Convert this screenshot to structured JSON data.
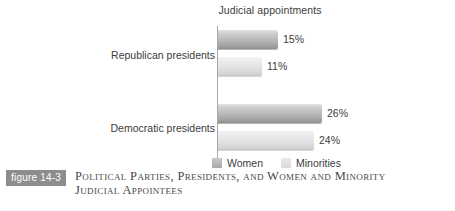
{
  "chart_data": {
    "type": "bar",
    "orientation": "horizontal",
    "title": "Judicial appointments",
    "xlabel": "",
    "ylabel": "",
    "categories": [
      "Republican presidents",
      "Democratic presidents"
    ],
    "series": [
      {
        "name": "Women",
        "color": "#b0b0b0",
        "values": [
          15,
          24
        ],
        "value_labels": [
          "15%",
          "26%"
        ]
      },
      {
        "name": "Minorities",
        "color": "#e0e0e0",
        "values": [
          11,
          24
        ],
        "value_labels": [
          "11%",
          "24%"
        ]
      }
    ],
    "bars": [
      {
        "category": "Republican presidents",
        "series": "Women",
        "value": 15,
        "label": "15%"
      },
      {
        "category": "Republican presidents",
        "series": "Minorities",
        "value": 11,
        "label": "11%"
      },
      {
        "category": "Democratic presidents",
        "series": "Women",
        "value": 26,
        "label": "26%"
      },
      {
        "category": "Democratic presidents",
        "series": "Minorities",
        "value": 24,
        "label": "24%"
      }
    ],
    "xlim": [
      0,
      30
    ],
    "grid": false,
    "legend_position": "bottom",
    "legend": [
      "Women",
      "Minorities"
    ],
    "value_suffix": "%"
  },
  "chart": {
    "title": "Judicial appointments",
    "categories": {
      "republican": "Republican presidents",
      "democratic": "Democratic presidents"
    },
    "values": {
      "rep_women": "15%",
      "rep_minorities": "11%",
      "dem_women": "26%",
      "dem_minorities": "24%"
    },
    "legend": {
      "women": "Women",
      "minorities": "Minorities"
    }
  },
  "caption": {
    "badge": "figure 14-3",
    "line1": "Political Parties, Presidents, and Women and Minority",
    "line2": "Judicial Appointees"
  },
  "colors": {
    "series_women": "#b0b0b0",
    "series_minorities": "#e0e0e0",
    "badge_background": "#8d8d8d",
    "axis": "#a9a9a9",
    "text": "#3c3c3c"
  }
}
